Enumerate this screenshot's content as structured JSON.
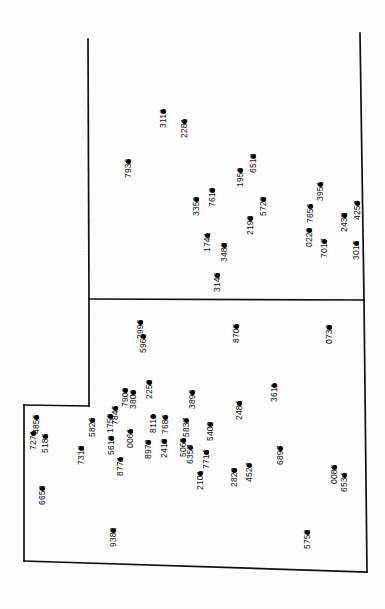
{
  "document": {
    "type": "survey-parcel-map",
    "orientation": "rotated-90-ccw",
    "background_color": "#ffffff",
    "line_color": "#111111",
    "point_color": "#000000",
    "label_color": "#0d0d0d"
  },
  "boundaries": {
    "outer_parcel": {
      "name": "outer-parcel-outline",
      "path": "M 88,39 L 89,299 L 89,406 L 24,406 L 24,561 L 367,571 L 364,300 L 360,33"
    },
    "divider": {
      "name": "parcel-divider-line",
      "path": "M 89,299 L 364,300"
    },
    "segments": [
      {
        "name": "top-left-vertical-edge",
        "x1": 88,
        "y1": 39,
        "x2": 89,
        "y2": 299
      },
      {
        "name": "mid-left-vertical-edge",
        "x1": 89,
        "y1": 299,
        "x2": 89,
        "y2": 406
      },
      {
        "name": "left-notch-horizontal",
        "x1": 89,
        "y1": 406,
        "x2": 24,
        "y2": 405
      },
      {
        "name": "far-left-vertical-edge",
        "x1": 24,
        "y1": 405,
        "x2": 24,
        "y2": 561
      },
      {
        "name": "bottom-edge",
        "x1": 24,
        "y1": 561,
        "x2": 367,
        "y2": 572
      },
      {
        "name": "right-lower-vertical",
        "x1": 367,
        "y1": 572,
        "x2": 364,
        "y2": 300
      },
      {
        "name": "right-upper-vertical",
        "x1": 364,
        "y1": 300,
        "x2": 360,
        "y2": 33
      },
      {
        "name": "horizontal-divider",
        "x1": 89,
        "y1": 299,
        "x2": 364,
        "y2": 300
      }
    ]
  },
  "points": [
    {
      "id": "7936",
      "x": 128,
      "y": 161,
      "lx": 123,
      "ly": 178
    },
    {
      "id": "3113",
      "x": 163,
      "y": 111,
      "lx": 158,
      "ly": 128
    },
    {
      "id": "2281",
      "x": 184,
      "y": 121,
      "lx": 179,
      "ly": 138
    },
    {
      "id": "6513",
      "x": 253,
      "y": 156,
      "lx": 248,
      "ly": 173
    },
    {
      "id": "1959",
      "x": 240,
      "y": 170,
      "lx": 235,
      "ly": 187
    },
    {
      "id": "7618",
      "x": 212,
      "y": 190,
      "lx": 207,
      "ly": 207
    },
    {
      "id": "3359",
      "x": 196,
      "y": 199,
      "lx": 191,
      "ly": 216
    },
    {
      "id": "3951",
      "x": 320,
      "y": 184,
      "lx": 315,
      "ly": 201
    },
    {
      "id": "5722",
      "x": 263,
      "y": 199,
      "lx": 258,
      "ly": 216
    },
    {
      "id": "7656",
      "x": 310,
      "y": 206,
      "lx": 305,
      "ly": 223
    },
    {
      "id": "4250",
      "x": 357,
      "y": 203,
      "lx": 352,
      "ly": 220
    },
    {
      "id": "2432",
      "x": 344,
      "y": 215,
      "lx": 339,
      "ly": 232
    },
    {
      "id": "2192",
      "x": 250,
      "y": 218,
      "lx": 245,
      "ly": 235
    },
    {
      "id": "0228",
      "x": 309,
      "y": 230,
      "lx": 304,
      "ly": 247
    },
    {
      "id": "1741",
      "x": 207,
      "y": 235,
      "lx": 202,
      "ly": 252
    },
    {
      "id": "3488",
      "x": 224,
      "y": 245,
      "lx": 219,
      "ly": 262
    },
    {
      "id": "7017",
      "x": 324,
      "y": 241,
      "lx": 319,
      "ly": 258
    },
    {
      "id": "3016",
      "x": 356,
      "y": 243,
      "lx": 351,
      "ly": 260
    },
    {
      "id": "3146",
      "x": 217,
      "y": 275,
      "lx": 212,
      "ly": 292
    },
    {
      "id": "2996",
      "x": 140,
      "y": 322,
      "lx": 135,
      "ly": 339
    },
    {
      "id": "5969",
      "x": 143,
      "y": 336,
      "lx": 138,
      "ly": 353
    },
    {
      "id": "8705",
      "x": 236,
      "y": 326,
      "lx": 231,
      "ly": 343
    },
    {
      "id": "0738",
      "x": 329,
      "y": 327,
      "lx": 324,
      "ly": 344
    },
    {
      "id": "7909",
      "x": 125,
      "y": 390,
      "lx": 120,
      "ly": 407
    },
    {
      "id": "2253",
      "x": 149,
      "y": 382,
      "lx": 144,
      "ly": 399
    },
    {
      "id": "3809",
      "x": 133,
      "y": 392,
      "lx": 128,
      "ly": 409
    },
    {
      "id": "3611",
      "x": 274,
      "y": 385,
      "lx": 269,
      "ly": 402
    },
    {
      "id": "3896",
      "x": 192,
      "y": 392,
      "lx": 187,
      "ly": 409
    },
    {
      "id": "4856",
      "x": 36,
      "y": 417,
      "lx": 31,
      "ly": 434
    },
    {
      "id": "7846",
      "x": 115,
      "y": 408,
      "lx": 110,
      "ly": 425
    },
    {
      "id": "1759",
      "x": 110,
      "y": 416,
      "lx": 105,
      "ly": 433
    },
    {
      "id": "5826",
      "x": 92,
      "y": 420,
      "lx": 87,
      "ly": 437
    },
    {
      "id": "8119",
      "x": 153,
      "y": 416,
      "lx": 148,
      "ly": 433
    },
    {
      "id": "7686",
      "x": 165,
      "y": 417,
      "lx": 160,
      "ly": 434
    },
    {
      "id": "5837",
      "x": 186,
      "y": 420,
      "lx": 181,
      "ly": 437
    },
    {
      "id": "2484",
      "x": 239,
      "y": 403,
      "lx": 234,
      "ly": 420
    },
    {
      "id": "7271",
      "x": 33,
      "y": 433,
      "lx": 28,
      "ly": 450
    },
    {
      "id": "5186",
      "x": 45,
      "y": 436,
      "lx": 40,
      "ly": 453
    },
    {
      "id": "0061",
      "x": 130,
      "y": 431,
      "lx": 125,
      "ly": 448
    },
    {
      "id": "5402",
      "x": 210,
      "y": 424,
      "lx": 205,
      "ly": 441
    },
    {
      "id": "5610",
      "x": 111,
      "y": 438,
      "lx": 106,
      "ly": 455
    },
    {
      "id": "8973",
      "x": 148,
      "y": 442,
      "lx": 143,
      "ly": 459
    },
    {
      "id": "2418",
      "x": 164,
      "y": 441,
      "lx": 159,
      "ly": 458
    },
    {
      "id": "5065",
      "x": 183,
      "y": 440,
      "lx": 178,
      "ly": 457
    },
    {
      "id": "6357",
      "x": 190,
      "y": 447,
      "lx": 185,
      "ly": 464
    },
    {
      "id": "7318",
      "x": 81,
      "y": 448,
      "lx": 76,
      "ly": 465
    },
    {
      "id": "7714",
      "x": 206,
      "y": 452,
      "lx": 201,
      "ly": 469
    },
    {
      "id": "6897",
      "x": 280,
      "y": 448,
      "lx": 275,
      "ly": 465
    },
    {
      "id": "8771",
      "x": 120,
      "y": 459,
      "lx": 115,
      "ly": 476
    },
    {
      "id": "4527",
      "x": 249,
      "y": 465,
      "lx": 244,
      "ly": 482
    },
    {
      "id": "2828",
      "x": 234,
      "y": 470,
      "lx": 229,
      "ly": 487
    },
    {
      "id": "2101",
      "x": 200,
      "y": 473,
      "lx": 195,
      "ly": 490
    },
    {
      "id": "0086",
      "x": 334,
      "y": 467,
      "lx": 329,
      "ly": 484
    },
    {
      "id": "6534",
      "x": 344,
      "y": 475,
      "lx": 339,
      "ly": 492
    },
    {
      "id": "6658",
      "x": 42,
      "y": 488,
      "lx": 37,
      "ly": 505
    },
    {
      "id": "9382",
      "x": 113,
      "y": 530,
      "lx": 108,
      "ly": 547
    },
    {
      "id": "5752",
      "x": 307,
      "y": 532,
      "lx": 302,
      "ly": 549
    }
  ]
}
